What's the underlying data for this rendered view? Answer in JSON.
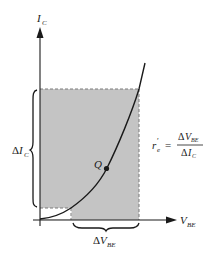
{
  "diagram": {
    "y_axis": {
      "label": "I",
      "subscript": "C"
    },
    "x_axis": {
      "label": "V",
      "subscript": "BE"
    },
    "operating_point": {
      "label": "Q"
    },
    "delta_ic": {
      "delta": "Δ",
      "label": "I",
      "subscript": "C"
    },
    "delta_vbe": {
      "delta": "Δ",
      "label": "V",
      "subscript": "BE"
    },
    "formula": {
      "lhs": "r",
      "lhs_prime": "′",
      "lhs_subscript": "e",
      "equals": "=",
      "numerator_delta": "Δ",
      "numerator": "V",
      "numerator_subscript": "BE",
      "denominator_delta": "Δ",
      "denominator": "I",
      "denominator_subscript": "C"
    },
    "colors": {
      "shade": "#c4c4c4",
      "line": "#1a1a1a",
      "dash": "#7a7a7a",
      "background": "#ffffff"
    }
  }
}
